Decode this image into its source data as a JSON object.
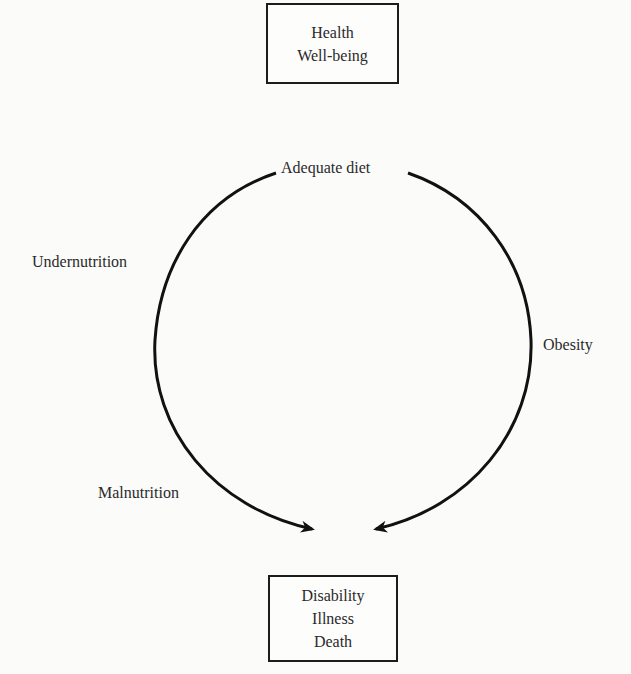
{
  "diagram": {
    "top_box": {
      "lines": [
        "Health",
        "Well-being"
      ]
    },
    "bottom_box": {
      "lines": [
        "Disability",
        "Illness",
        "Death"
      ]
    },
    "labels": {
      "top": "Adequate diet",
      "left_upper": "Undernutrition",
      "left_lower": "Malnutrition",
      "right": "Obesity"
    },
    "arrows": [
      {
        "from": "Adequate diet",
        "via": [
          "Undernutrition",
          "Malnutrition"
        ],
        "to": "Disability / Illness / Death"
      },
      {
        "from": "Adequate diet",
        "via": [
          "Obesity"
        ],
        "to": "Disability / Illness / Death"
      }
    ],
    "colors": {
      "stroke": "#111111",
      "text": "#2a2a2a",
      "background": "#fbfbfa"
    }
  }
}
